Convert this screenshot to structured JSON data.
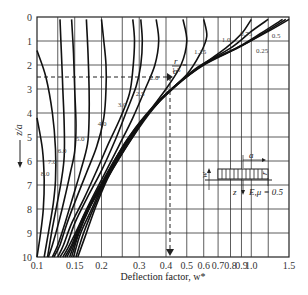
{
  "chart_data": {
    "type": "line",
    "title": "",
    "xlabel": "Deflection factor, w*",
    "ylabel": "z/a",
    "xscale": "log",
    "xlim": [
      0.1,
      1.5
    ],
    "ylim": [
      10,
      0
    ],
    "y_inverted": true,
    "grid": true,
    "x_ticks": [
      0.1,
      0.15,
      0.2,
      0.3,
      0.4,
      0.5,
      0.6,
      0.7,
      0.8,
      0.9,
      1.0,
      1.5
    ],
    "x_tick_labels": [
      "0.1",
      "0.15",
      "0.2",
      "0.3",
      "0.4",
      "0.5",
      "0.6",
      "0.7",
      "0.8",
      "0.9",
      "1.0",
      "1.5"
    ],
    "y_ticks": [
      0,
      1,
      2,
      3,
      4,
      5,
      6,
      7,
      8,
      9,
      10
    ],
    "y_tick_labels": [
      "0",
      "1",
      "2",
      "3",
      "4",
      "5",
      "6",
      "7",
      "8",
      "9",
      "10"
    ],
    "parameter_label": "r/a =",
    "series": [
      {
        "name": "r/a = 0",
        "points": [
          [
            1.5,
            0.1
          ],
          [
            1.2,
            0.6
          ],
          [
            0.9,
            1.2
          ],
          [
            0.62,
            1.9
          ],
          [
            0.45,
            2.8
          ],
          [
            0.35,
            3.8
          ],
          [
            0.28,
            5
          ],
          [
            0.22,
            6.5
          ],
          [
            0.19,
            7.8
          ],
          [
            0.17,
            9
          ],
          [
            0.155,
            10
          ]
        ]
      },
      {
        "name": "r/a = 0.25",
        "points": [
          [
            1.45,
            0.1
          ],
          [
            1.15,
            0.65
          ],
          [
            0.88,
            1.25
          ],
          [
            0.6,
            2.0
          ],
          [
            0.44,
            2.9
          ],
          [
            0.34,
            3.9
          ],
          [
            0.27,
            5.1
          ],
          [
            0.215,
            6.6
          ],
          [
            0.185,
            7.9
          ],
          [
            0.165,
            9
          ],
          [
            0.152,
            10
          ]
        ]
      },
      {
        "name": "r/a = 0.5",
        "points": [
          [
            1.4,
            0.1
          ],
          [
            1.1,
            0.7
          ],
          [
            0.85,
            1.3
          ],
          [
            0.58,
            2.05
          ],
          [
            0.43,
            3.0
          ],
          [
            0.33,
            4.0
          ],
          [
            0.26,
            5.2
          ],
          [
            0.21,
            6.7
          ],
          [
            0.18,
            8
          ],
          [
            0.16,
            9
          ],
          [
            0.148,
            10
          ]
        ]
      },
      {
        "name": "r/a = 0.75",
        "points": [
          [
            1.2,
            0.1
          ],
          [
            1.0,
            0.6
          ],
          [
            0.8,
            1.3
          ],
          [
            0.56,
            2.1
          ],
          [
            0.42,
            3.05
          ],
          [
            0.32,
            4.1
          ],
          [
            0.255,
            5.3
          ],
          [
            0.205,
            6.8
          ],
          [
            0.175,
            8
          ],
          [
            0.157,
            9
          ],
          [
            0.145,
            10
          ]
        ]
      },
      {
        "name": "r/a = 1.0",
        "points": [
          [
            1.0,
            0.1
          ],
          [
            0.9,
            0.7
          ],
          [
            0.76,
            1.3
          ],
          [
            0.55,
            2.2
          ],
          [
            0.4,
            3.2
          ],
          [
            0.31,
            4.3
          ],
          [
            0.25,
            5.5
          ],
          [
            0.2,
            7
          ],
          [
            0.17,
            8.2
          ],
          [
            0.153,
            9.2
          ],
          [
            0.142,
            10
          ]
        ]
      },
      {
        "name": "r/a = 1.25",
        "points": [
          [
            0.6,
            0.1
          ],
          [
            0.62,
            0.8
          ],
          [
            0.58,
            1.5
          ],
          [
            0.5,
            2.4
          ],
          [
            0.38,
            3.4
          ],
          [
            0.3,
            4.5
          ],
          [
            0.24,
            5.7
          ],
          [
            0.195,
            7.1
          ],
          [
            0.165,
            8.3
          ],
          [
            0.15,
            9.3
          ],
          [
            0.138,
            10
          ]
        ]
      },
      {
        "name": "r/a = 1.5",
        "points": [
          [
            0.48,
            0.1
          ],
          [
            0.5,
            1.0
          ],
          [
            0.47,
            2.0
          ],
          [
            0.4,
            3.0
          ],
          [
            0.33,
            4.0
          ],
          [
            0.27,
            5.2
          ],
          [
            0.22,
            6.5
          ],
          [
            0.185,
            7.6
          ],
          [
            0.16,
            8.6
          ],
          [
            0.145,
            9.5
          ],
          [
            0.135,
            10
          ]
        ]
      },
      {
        "name": "r/a = 2.0",
        "points": [
          [
            0.36,
            0.1
          ],
          [
            0.37,
            1.0
          ],
          [
            0.355,
            2.0
          ],
          [
            0.32,
            3.0
          ],
          [
            0.28,
            4.2
          ],
          [
            0.24,
            5.4
          ],
          [
            0.205,
            6.6
          ],
          [
            0.175,
            7.8
          ],
          [
            0.155,
            8.8
          ],
          [
            0.14,
            9.6
          ],
          [
            0.132,
            10
          ]
        ]
      },
      {
        "name": "r/a = 2.5",
        "points": [
          [
            0.305,
            0.1
          ],
          [
            0.31,
            1.0
          ],
          [
            0.305,
            2.0
          ],
          [
            0.29,
            2.9
          ],
          [
            0.26,
            4.0
          ],
          [
            0.23,
            5.2
          ],
          [
            0.2,
            6.4
          ],
          [
            0.17,
            7.6
          ],
          [
            0.15,
            8.6
          ],
          [
            0.138,
            9.5
          ],
          [
            0.128,
            10
          ]
        ]
      },
      {
        "name": "r/a = 3.0",
        "points": [
          [
            0.28,
            0.1
          ],
          [
            0.285,
            1.0
          ],
          [
            0.28,
            2.2
          ],
          [
            0.27,
            3.2
          ],
          [
            0.245,
            4.2
          ],
          [
            0.215,
            5.3
          ],
          [
            0.19,
            6.4
          ],
          [
            0.165,
            7.6
          ],
          [
            0.145,
            8.6
          ],
          [
            0.133,
            9.5
          ],
          [
            0.125,
            10
          ]
        ]
      },
      {
        "name": "r/a = 4.0",
        "points": [
          [
            0.2,
            0.1
          ],
          [
            0.205,
            1.0
          ],
          [
            0.21,
            2.0
          ],
          [
            0.21,
            3.0
          ],
          [
            0.205,
            4.2
          ],
          [
            0.19,
            5.4
          ],
          [
            0.17,
            6.5
          ],
          [
            0.152,
            7.6
          ],
          [
            0.138,
            8.6
          ],
          [
            0.128,
            9.5
          ],
          [
            0.12,
            10
          ]
        ]
      },
      {
        "name": "r/a = 5.0",
        "points": [
          [
            0.17,
            0.1
          ],
          [
            0.173,
            1.5
          ],
          [
            0.175,
            3.0
          ],
          [
            0.175,
            4.2
          ],
          [
            0.172,
            5.3
          ],
          [
            0.16,
            6.4
          ],
          [
            0.147,
            7.5
          ],
          [
            0.135,
            8.6
          ],
          [
            0.125,
            9.5
          ],
          [
            0.118,
            10
          ]
        ]
      },
      {
        "name": "r/a = 6.0",
        "points": [
          [
            0.145,
            0.1
          ],
          [
            0.148,
            1.5
          ],
          [
            0.15,
            3.0
          ],
          [
            0.152,
            4.5
          ],
          [
            0.15,
            5.6
          ],
          [
            0.143,
            6.5
          ],
          [
            0.135,
            7.5
          ],
          [
            0.126,
            8.6
          ],
          [
            0.118,
            9.5
          ],
          [
            0.113,
            10
          ]
        ]
      },
      {
        "name": "r/a = 7.0",
        "points": [
          [
            0.128,
            0.1
          ],
          [
            0.13,
            1.5
          ],
          [
            0.132,
            3.0
          ],
          [
            0.134,
            4.5
          ],
          [
            0.134,
            5.8
          ],
          [
            0.13,
            6.8
          ],
          [
            0.124,
            7.8
          ],
          [
            0.118,
            8.8
          ],
          [
            0.112,
            10
          ]
        ]
      },
      {
        "name": "r/a = 8.0",
        "points": [
          [
            0.1,
            1.4
          ],
          [
            0.11,
            2.5
          ],
          [
            0.118,
            4.0
          ],
          [
            0.122,
            5.5
          ],
          [
            0.122,
            6.8
          ],
          [
            0.119,
            7.8
          ],
          [
            0.114,
            8.8
          ],
          [
            0.108,
            10
          ]
        ]
      },
      {
        "name": "r/a = 8.0 (lower)",
        "points": [
          [
            0.1,
            4.2
          ],
          [
            0.106,
            5.5
          ],
          [
            0.108,
            6.8
          ],
          [
            0.107,
            8.0
          ],
          [
            0.104,
            9.0
          ],
          [
            0.1,
            10
          ]
        ]
      }
    ],
    "curve_labels": [
      "0.25",
      "0.5",
      "0.75",
      "1.0",
      "1.25",
      "1.5",
      "2.0",
      "2.5",
      "3.0",
      "4.0",
      "5.0",
      "6.0",
      "7.0",
      "8.0"
    ],
    "annotations": [
      {
        "type": "dashed-arrow",
        "description": "horizontal dashed line at z/a = 2.5 to r/a = 2.0 curve then vertical dashed arrow down to w* ≈ 0.42"
      },
      {
        "type": "inset",
        "labels": [
          "a",
          "r",
          "w",
          "z",
          "E,μ = 0.5"
        ]
      }
    ]
  },
  "labels": {
    "xlabel": "Deflection factor, w*",
    "ylabel": "z/a",
    "r_over_a": "r",
    "r_over_a_den": "a",
    "r_over_a_eq": "=",
    "inset_a": "a",
    "inset_r": "r",
    "inset_w": "w",
    "inset_z": "z",
    "inset_material": "E,μ = 0.5"
  }
}
